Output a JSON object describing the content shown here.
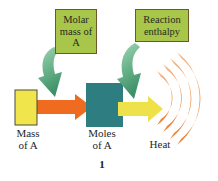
{
  "figure": {
    "number": "1",
    "background_color": "#ffffff"
  },
  "nodes": [
    {
      "id": "mass",
      "label": "Mass\nof A",
      "shape": "rectangle",
      "fill_color": "#f0e64b",
      "border_color": "#4a4a3a"
    },
    {
      "id": "moles",
      "label": "Moles\nof A",
      "shape": "rectangle",
      "fill_color": "#2e7d80",
      "border_color": "#2e7d80"
    },
    {
      "id": "heat",
      "label": "Heat",
      "shape": "radiating-arcs",
      "fill_color": "#ef8b3c",
      "arc_count": 4
    }
  ],
  "flow_arrows": [
    {
      "id": "mass-to-moles",
      "color": "#ee6b1f",
      "direction": "right"
    },
    {
      "id": "moles-to-heat",
      "color": "#efe14a",
      "direction": "right"
    }
  ],
  "annotations": [
    {
      "id": "molar-mass",
      "label": "Molar\nmass\nof A",
      "fill_color": "#a8c64a",
      "border_color": "#6b5a28",
      "arrow_color": "#4a9b72",
      "targets": "mass-to-moles"
    },
    {
      "id": "reaction-enthalpy",
      "label": "Reaction\nenthalpy",
      "fill_color": "#a8c64a",
      "border_color": "#6b5a28",
      "arrow_color": "#4a9b72",
      "targets": "moles-to-heat"
    }
  ],
  "icons": {
    "curved_arrow": "curved-arrow-icon",
    "block_arrow": "block-arrow-icon",
    "heat_waves": "heat-waves-icon"
  }
}
